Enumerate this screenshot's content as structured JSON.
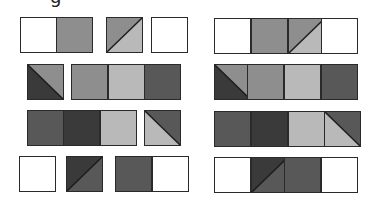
{
  "header": {
    "clipped_text": "g"
  },
  "colors": {
    "white": "#ffffff",
    "light": "#b9b9b9",
    "medium": "#8e8e8e",
    "dark": "#585858",
    "darker": "#3a3a3a"
  },
  "panels": [
    {
      "name": "left-panel",
      "rows": [
        {
          "y": 17,
          "tiles": [
            {
              "x": 20,
              "fill": "white"
            },
            {
              "x": 56,
              "fill": "medium"
            },
            {
              "x": 106,
              "split": "bl-tr",
              "a": "medium",
              "b": "light"
            },
            {
              "x": 151,
              "fill": "white"
            }
          ]
        },
        {
          "y": 64,
          "tiles": [
            {
              "x": 27,
              "split": "tl-br",
              "a": "medium",
              "b": "darker"
            },
            {
              "x": 71,
              "fill": "medium"
            },
            {
              "x": 108,
              "fill": "light"
            },
            {
              "x": 144,
              "fill": "dark"
            }
          ]
        },
        {
          "y": 110,
          "tiles": [
            {
              "x": 27,
              "fill": "dark"
            },
            {
              "x": 63,
              "fill": "darker"
            },
            {
              "x": 100,
              "fill": "light"
            },
            {
              "x": 144,
              "split": "tl-br",
              "a": "dark",
              "b": "light"
            }
          ]
        },
        {
          "y": 156,
          "tiles": [
            {
              "x": 19,
              "fill": "white"
            },
            {
              "x": 66,
              "split": "bl-tr",
              "a": "darker",
              "b": "dark"
            },
            {
              "x": 115,
              "fill": "dark"
            },
            {
              "x": 152,
              "fill": "white"
            }
          ]
        }
      ]
    },
    {
      "name": "right-panel",
      "rows": [
        {
          "y": 18,
          "tiles": [
            {
              "x": 214,
              "fill": "white"
            },
            {
              "x": 251,
              "fill": "medium"
            },
            {
              "x": 288,
              "split": "bl-tr",
              "a": "medium",
              "b": "light"
            },
            {
              "x": 321,
              "fill": "white"
            }
          ]
        },
        {
          "y": 64,
          "tiles": [
            {
              "x": 214,
              "split": "tl-br",
              "a": "medium",
              "b": "darker"
            },
            {
              "x": 247,
              "fill": "medium"
            },
            {
              "x": 284,
              "fill": "light"
            },
            {
              "x": 321,
              "fill": "dark"
            }
          ]
        },
        {
          "y": 111,
          "tiles": [
            {
              "x": 214,
              "fill": "dark"
            },
            {
              "x": 251,
              "fill": "darker"
            },
            {
              "x": 288,
              "fill": "light"
            },
            {
              "x": 324,
              "split": "tl-br",
              "a": "dark",
              "b": "light"
            }
          ]
        },
        {
          "y": 157,
          "tiles": [
            {
              "x": 214,
              "fill": "white"
            },
            {
              "x": 251,
              "split": "bl-tr",
              "a": "darker",
              "b": "dark"
            },
            {
              "x": 284,
              "fill": "dark"
            },
            {
              "x": 321,
              "fill": "white"
            }
          ]
        }
      ]
    }
  ],
  "tile_size": {
    "w": 37,
    "h": 36
  }
}
